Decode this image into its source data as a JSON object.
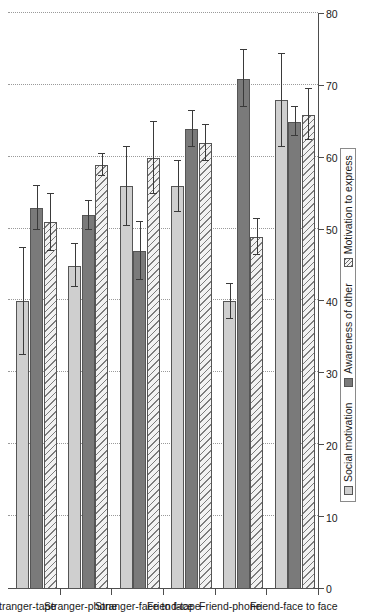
{
  "chart_data": {
    "type": "bar",
    "orientation": "horizontal",
    "title": "",
    "xlabel": "",
    "ylabel": "",
    "ylim": [
      0,
      80
    ],
    "yticks": [
      0,
      10,
      20,
      30,
      40,
      50,
      60,
      70,
      80
    ],
    "grid": true,
    "legend_position": "bottom",
    "categories": [
      "Stranger-tape",
      "Stranger-phone",
      "Stranger-face to face",
      "Friend-tape",
      "Friend-phone",
      "Friend-face to face"
    ],
    "series": [
      {
        "name": "Social motivation",
        "color": "#cfcfcf",
        "values": [
          40,
          45,
          56,
          56,
          40,
          68
        ],
        "errors": [
          7.5,
          3.0,
          5.5,
          3.5,
          2.5,
          6.5
        ]
      },
      {
        "name": "Awareness of other",
        "color": "#7a7a7a",
        "values": [
          53,
          52,
          47,
          64,
          71,
          65
        ],
        "errors": [
          3.0,
          2.0,
          4.0,
          2.5,
          4.0,
          2.0
        ]
      },
      {
        "name": "Motivation to express",
        "color": "#f2f2f2",
        "values": [
          51,
          59,
          60,
          62,
          49,
          66
        ],
        "errors": [
          4.0,
          1.5,
          5.0,
          2.5,
          2.5,
          3.5
        ]
      }
    ]
  },
  "axis": {
    "tick_labels": [
      "0",
      "10",
      "20",
      "30",
      "40",
      "50",
      "60",
      "70",
      "80"
    ]
  },
  "legend": {
    "items": [
      {
        "label": "Social motivation",
        "swatch": "light-gray-swatch"
      },
      {
        "label": "Awareness of other",
        "swatch": "dark-gray-swatch"
      },
      {
        "label": "Motivation to express",
        "swatch": "hatched-swatch"
      }
    ]
  }
}
